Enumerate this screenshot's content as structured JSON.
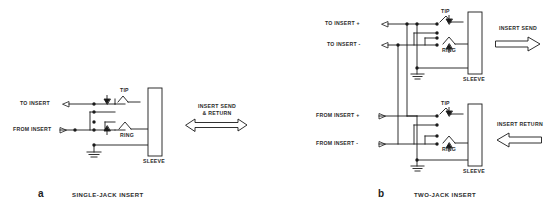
{
  "figure": {
    "title_implicit": "",
    "background": "#ffffff",
    "line_color": "#1a1a1a",
    "text_color": "#2b2b2b"
  },
  "panel_a": {
    "caption_letter": "a",
    "caption_text": "SINGLE-JACK INSERT",
    "terminals": [
      {
        "label": "TO INSERT",
        "direction": "in"
      },
      {
        "label": "FROM INSERT",
        "direction": "out"
      }
    ],
    "jack": {
      "tip_label": "TIP",
      "ring_label": "RING",
      "sleeve_label": "SLEEVE"
    },
    "flow_arrow": {
      "line1": "INSERT SEND",
      "line2": "& RETURN",
      "style": "double-headed"
    }
  },
  "panel_b": {
    "caption_letter": "b",
    "caption_text": "TWO-JACK INSERT",
    "send_jack": {
      "terminals": [
        {
          "label": "TO INSERT +",
          "direction": "in"
        },
        {
          "label": "TO INSERT -",
          "direction": "in"
        }
      ],
      "tip_label": "TIP",
      "ring_label": "RING",
      "sleeve_label": "SLEEVE",
      "flow_arrow": {
        "line1": "INSERT SEND",
        "style": "right"
      }
    },
    "return_jack": {
      "terminals": [
        {
          "label": "FROM INSERT +",
          "direction": "out"
        },
        {
          "label": "FROM INSERT -",
          "direction": "out"
        }
      ],
      "tip_label": "TIP",
      "ring_label": "RING",
      "sleeve_label": "SLEEVE",
      "flow_arrow": {
        "line1": "INSERT RETURN",
        "style": "left"
      }
    }
  }
}
